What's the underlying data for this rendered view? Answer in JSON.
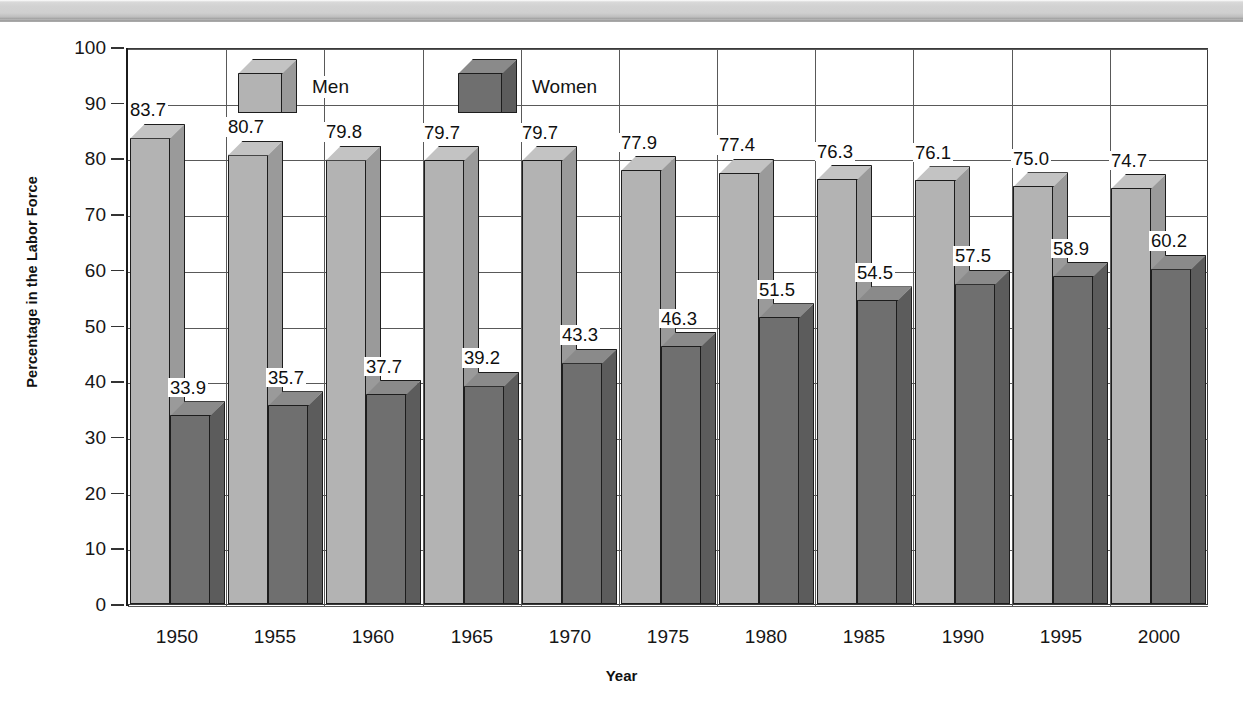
{
  "chart_data": {
    "type": "bar",
    "title": "",
    "subtitle": "",
    "xlabel": "Year",
    "ylabel": "Percentage in the Labor Force",
    "categories": [
      "1950",
      "1955",
      "1960",
      "1965",
      "1970",
      "1975",
      "1980",
      "1985",
      "1990",
      "1995",
      "2000"
    ],
    "series": [
      {
        "name": "Men",
        "color": "#b3b3b3",
        "values": [
          83.7,
          80.7,
          79.8,
          79.7,
          79.7,
          77.9,
          77.4,
          76.3,
          76.1,
          75.0,
          74.7
        ],
        "labels": [
          "83.7",
          "80.7",
          "79.8",
          "79.7",
          "79.7",
          "77.9",
          "77.4",
          "76.3",
          "76.1",
          "75.0",
          "74.7"
        ]
      },
      {
        "name": "Women",
        "color": "#6f6f6f",
        "values": [
          33.9,
          35.7,
          37.7,
          39.2,
          43.3,
          46.3,
          51.5,
          54.5,
          57.5,
          58.9,
          60.2
        ],
        "labels": [
          "33.9",
          "35.7",
          "37.7",
          "39.2",
          "43.3",
          "46.3",
          "51.5",
          "54.5",
          "57.5",
          "58.9",
          "60.2"
        ]
      }
    ],
    "ylim": [
      0,
      100
    ],
    "yticks": [
      0,
      10,
      20,
      30,
      40,
      50,
      60,
      70,
      80,
      90,
      100
    ],
    "ytick_labels": [
      "0",
      "10",
      "20",
      "30",
      "40",
      "50",
      "60",
      "70",
      "80",
      "90",
      "100"
    ],
    "grid": {
      "horizontal": true,
      "vertical": true
    },
    "legend": {
      "position": "top-left-inside",
      "entries": [
        {
          "label": "Men",
          "swatch": "light-gray-cube-icon"
        },
        {
          "label": "Women",
          "swatch": "dark-gray-cube-icon"
        }
      ]
    },
    "style": "3d-column"
  }
}
